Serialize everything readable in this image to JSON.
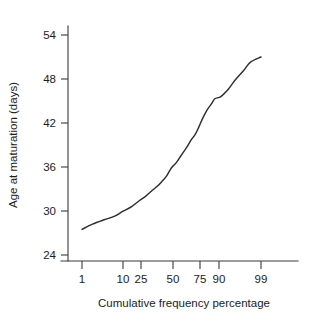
{
  "chart_data": {
    "type": "line",
    "title": "",
    "subtitle": "",
    "xlabel": "Cumulative frequency percentage",
    "ylabel": "Age at maturation  (days)",
    "grid": false,
    "legend": null,
    "x_scale": "probit",
    "x_tick_labels": [
      "1",
      "10",
      "25",
      "50",
      "75",
      "90",
      "99"
    ],
    "x_tick_values": [
      1,
      10,
      25,
      50,
      75,
      90,
      99
    ],
    "y_tick_labels": [
      "24",
      "30",
      "36",
      "42",
      "48",
      "54"
    ],
    "y_tick_values": [
      24,
      30,
      36,
      42,
      48,
      54
    ],
    "ylim": [
      22.5,
      56
    ],
    "xlim": [
      0.3,
      99.9
    ],
    "series": [
      {
        "name": "Age at maturation",
        "x": [
          1,
          2,
          4,
          7,
          10,
          15,
          20,
          25,
          30,
          35,
          40,
          45,
          50,
          55,
          60,
          65,
          70,
          73,
          76,
          79,
          82,
          85,
          87,
          90,
          93,
          95,
          97,
          98,
          99
        ],
        "values": [
          27.5,
          28.2,
          28.8,
          29.3,
          29.9,
          30.6,
          31.4,
          32.0,
          32.7,
          33.3,
          34.0,
          34.8,
          35.9,
          36.6,
          37.6,
          38.6,
          39.8,
          40.4,
          41.4,
          42.6,
          43.7,
          44.6,
          45.3,
          45.6,
          46.6,
          47.8,
          49.2,
          50.3,
          51.0
        ]
      }
    ]
  },
  "axes": {
    "y_title": "Age at maturation  (days)",
    "x_title": "Cumulative frequency percentage",
    "y_ticks": [
      {
        "label": "54"
      },
      {
        "label": "48"
      },
      {
        "label": "42"
      },
      {
        "label": "36"
      },
      {
        "label": "30"
      },
      {
        "label": "24"
      }
    ],
    "x_ticks": [
      {
        "label": "1"
      },
      {
        "label": "10"
      },
      {
        "label": "25"
      },
      {
        "label": "50"
      },
      {
        "label": "75"
      },
      {
        "label": "90"
      },
      {
        "label": "99"
      }
    ]
  },
  "colors": {
    "curve": "#2e2e2e",
    "axis": "#3a3a3a",
    "text": "#1c1c1c",
    "background": "#ffffff"
  }
}
